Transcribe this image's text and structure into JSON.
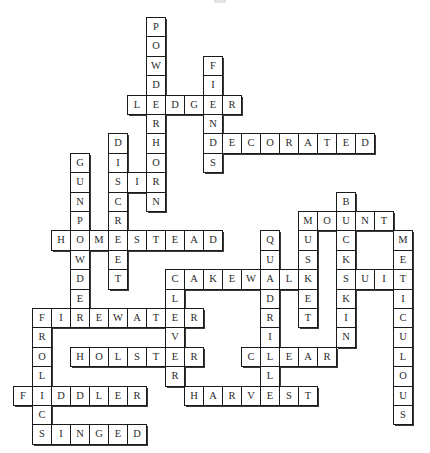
{
  "puzzle": {
    "type": "crossword",
    "grid": {
      "origin_x": 13,
      "origin_y": 17,
      "cell_w": 19,
      "cell_h": 19.4,
      "border_color": "#1a1a1a",
      "shadow_color": "#3a3a3a",
      "cell_fill": "#ffffff",
      "text_color": "#2a2a2a"
    },
    "words": [
      {
        "answer": "POWDERHORN",
        "row": 0,
        "col": 7,
        "dir": "down"
      },
      {
        "answer": "FIENDS",
        "row": 2,
        "col": 10,
        "dir": "down"
      },
      {
        "answer": "LEDGER",
        "row": 4,
        "col": 6,
        "dir": "across"
      },
      {
        "answer": "DECORATED",
        "row": 6,
        "col": 10,
        "dir": "across"
      },
      {
        "answer": "DISCREET",
        "row": 6,
        "col": 5,
        "dir": "down"
      },
      {
        "answer": "GUNPOWDER",
        "row": 7,
        "col": 3,
        "dir": "down"
      },
      {
        "answer": "SIR",
        "row": 8,
        "col": 5,
        "dir": "across"
      },
      {
        "answer": "BUCKSKIN",
        "row": 9,
        "col": 17,
        "dir": "down"
      },
      {
        "answer": "MOUNT",
        "row": 10,
        "col": 15,
        "dir": "across"
      },
      {
        "answer": "MUSKET",
        "row": 10,
        "col": 15,
        "dir": "down"
      },
      {
        "answer": "HOMESTEAD",
        "row": 11,
        "col": 2,
        "dir": "across"
      },
      {
        "answer": "QUADRILLE",
        "row": 11,
        "col": 13,
        "dir": "down"
      },
      {
        "answer": "METICULOUS",
        "row": 11,
        "col": 20,
        "dir": "down"
      },
      {
        "answer": "CAKEWALK",
        "row": 13,
        "col": 8,
        "dir": "across"
      },
      {
        "answer": "SUIT",
        "row": 13,
        "col": 17,
        "dir": "across"
      },
      {
        "answer": "CLEVER",
        "row": 13,
        "col": 8,
        "dir": "down"
      },
      {
        "answer": "FIREWATER",
        "row": 15,
        "col": 1,
        "dir": "across"
      },
      {
        "answer": "FROLICS",
        "row": 15,
        "col": 1,
        "dir": "down"
      },
      {
        "answer": "HOLSTER",
        "row": 17,
        "col": 3,
        "dir": "across"
      },
      {
        "answer": "CLEAR",
        "row": 17,
        "col": 12,
        "dir": "across"
      },
      {
        "answer": "FIDDLER",
        "row": 19,
        "col": 0,
        "dir": "across"
      },
      {
        "answer": "HARVEST",
        "row": 19,
        "col": 9,
        "dir": "across"
      },
      {
        "answer": "SINGED",
        "row": 21,
        "col": 1,
        "dir": "across"
      }
    ]
  }
}
